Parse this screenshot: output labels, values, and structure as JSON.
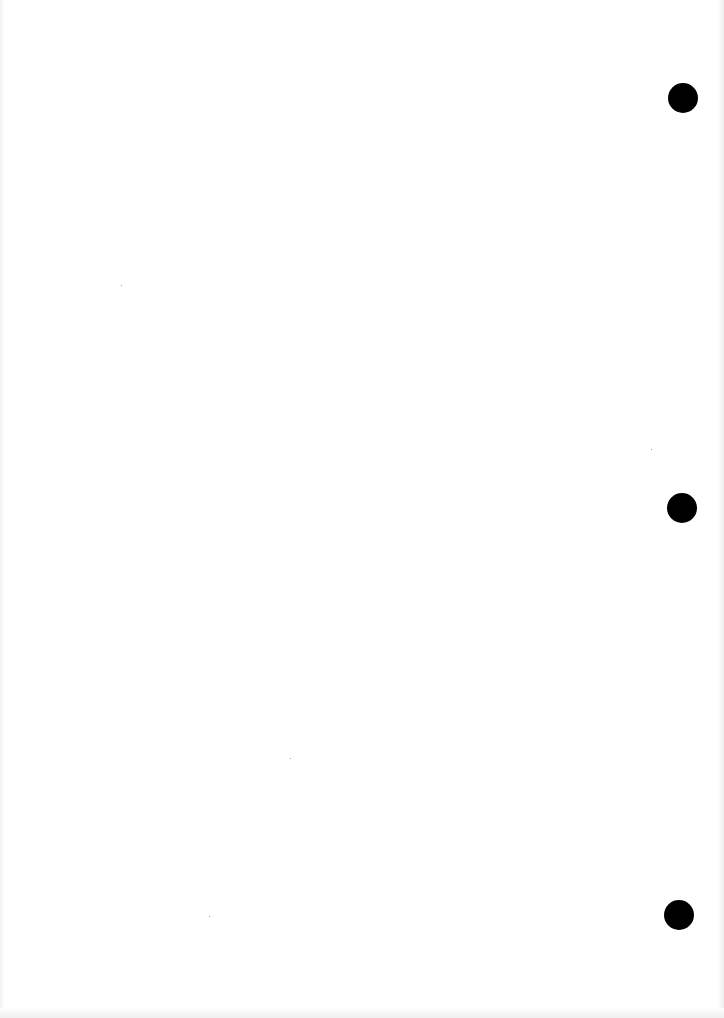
{
  "document": {
    "type": "blank scanned page",
    "text": "",
    "background_color": "#ffffff",
    "punch_holes": [
      {
        "cx": 683,
        "cy": 98,
        "diameter": 30,
        "color": "#000000"
      },
      {
        "cx": 682,
        "cy": 508,
        "diameter": 30,
        "color": "#000000"
      },
      {
        "cx": 679,
        "cy": 915,
        "diameter": 30,
        "color": "#000000"
      }
    ]
  }
}
